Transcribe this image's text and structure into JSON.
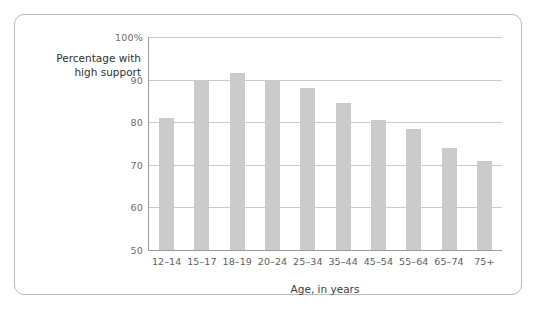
{
  "chart_data": {
    "type": "bar",
    "title": "",
    "categories": [
      "12–14",
      "15–17",
      "18–19",
      "20–24",
      "25–34",
      "35–44",
      "45–54",
      "55–64",
      "65–74",
      "75+"
    ],
    "values": [
      81,
      90,
      91.5,
      90,
      88,
      84.5,
      80.5,
      78.5,
      74,
      71
    ],
    "xlabel": "Age, in years",
    "ylabel_line1": "Percentage with",
    "ylabel_line2": "high support",
    "ylim": [
      50,
      100
    ],
    "yticks": [
      50,
      60,
      70,
      80,
      90,
      100
    ],
    "ytick_labels": [
      "50",
      "60",
      "70",
      "80",
      "90",
      "100%"
    ],
    "grid": true,
    "legend": "none",
    "bar_color": "#cbcbcb",
    "gridline_color": "#c9c9c9",
    "axis_color": "#9a9a9a",
    "frame_color": "#bcbcbc"
  }
}
